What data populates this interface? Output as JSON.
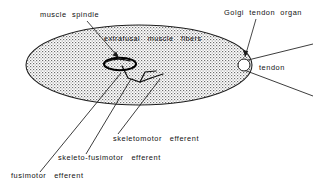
{
  "figure": {
    "background_color": "#ffffff",
    "ink_color": "#1a1a1a"
  },
  "labels": {
    "muscle_spindle": "muscle  spindle",
    "golgi_tendon_organ": "Golgi  tendon  organ",
    "extrafusal_muscle_fibers": "extrafusal   muscle   fibers",
    "tendon": "tendon",
    "skeletomotor_efferent": "skeletomotor   efferent",
    "skeleto_fusimotor_efferent": "skeleto-fusimotor   efferent",
    "fusimotor_efferent": "fusimotor   efferent"
  },
  "parts": {
    "muscle_belly": "extrafusal muscle fiber mass, stippled ellipse",
    "muscle_spindle": "intrafusal fiber capsule",
    "golgi_tendon_organ": "receptor circle at musculotendinous junction",
    "tendon": "tendon wedge"
  }
}
